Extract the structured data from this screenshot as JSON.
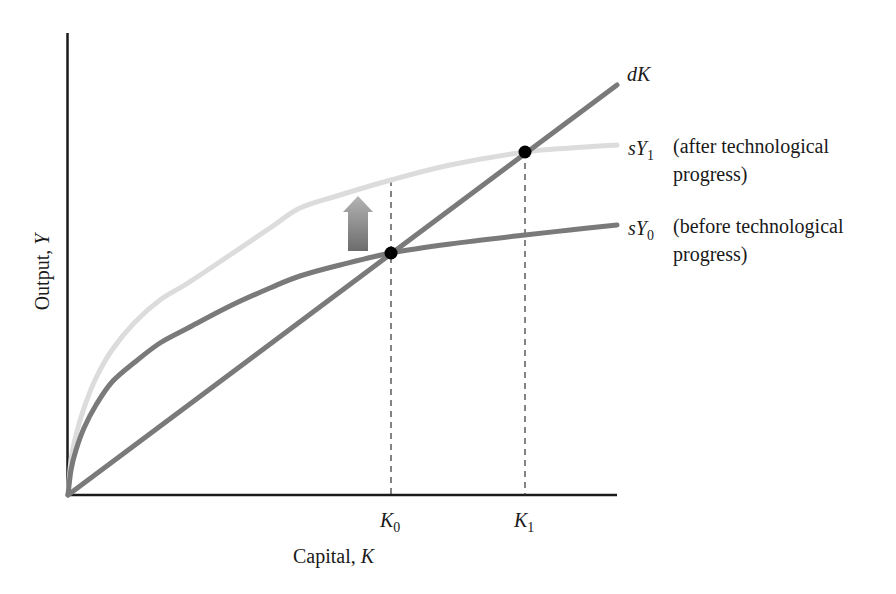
{
  "chart_data": {
    "type": "line",
    "title": "",
    "xlabel": "Capital, K",
    "ylabel": "Output, Y",
    "grid": false,
    "legend_position": "inline-right",
    "x_ticks": [
      "K0",
      "K1"
    ],
    "series": [
      {
        "name": "dK",
        "label": "dK",
        "color": "#7a7a7a",
        "style": "straight line through origin",
        "points": [
          [
            68,
            495
          ],
          [
            617,
            85
          ]
        ]
      },
      {
        "name": "sY1",
        "label": "sY1",
        "description": "(after technological progress)",
        "color": "#dcdcdc",
        "style": "concave curve",
        "points": [
          [
            68,
            495
          ],
          [
            71,
            460
          ],
          [
            76,
            435
          ],
          [
            84,
            408
          ],
          [
            96,
            378
          ],
          [
            112,
            350
          ],
          [
            135,
            322
          ],
          [
            160,
            300
          ],
          [
            188,
            283
          ],
          [
            230,
            255
          ],
          [
            270,
            228
          ],
          [
            300,
            208
          ],
          [
            340,
            195
          ],
          [
            391,
            180
          ],
          [
            450,
            165
          ],
          [
            525,
            152
          ],
          [
            570,
            148
          ],
          [
            617,
            145
          ]
        ]
      },
      {
        "name": "sY0",
        "label": "sY0",
        "description": "(before technological progress)",
        "color": "#7a7a7a",
        "style": "concave curve",
        "points": [
          [
            68,
            495
          ],
          [
            71,
            470
          ],
          [
            76,
            450
          ],
          [
            84,
            428
          ],
          [
            96,
            405
          ],
          [
            112,
            382
          ],
          [
            135,
            362
          ],
          [
            160,
            343
          ],
          [
            188,
            328
          ],
          [
            230,
            306
          ],
          [
            270,
            288
          ],
          [
            300,
            276
          ],
          [
            340,
            265
          ],
          [
            391,
            253
          ],
          [
            450,
            244
          ],
          [
            525,
            235
          ],
          [
            570,
            230
          ],
          [
            617,
            225
          ]
        ]
      }
    ],
    "equilibria": [
      {
        "name": "K0",
        "x": 391,
        "y": 253,
        "dashed_from_y": 180
      },
      {
        "name": "K1",
        "x": 525,
        "y": 152,
        "dashed_from_y": 152
      }
    ],
    "annotations": [
      "upward shift arrow from sY0 to sY1"
    ]
  },
  "labels": {
    "dK": "dK",
    "sY1_s": "sY",
    "sY1_sub": "1",
    "sY1_desc_line1": "(after technological",
    "sY1_desc_line2": "progress)",
    "sY0_s": "sY",
    "sY0_sub": "0",
    "sY0_desc_line1": "(before technological",
    "sY0_desc_line2": "progress)",
    "k0": "K",
    "k0_sub": "0",
    "k1": "K",
    "k1_sub": "1",
    "xlabel_text": "Capital, ",
    "xlabel_var": "K",
    "ylabel_text": "Output, ",
    "ylabel_var": "Y"
  },
  "colors": {
    "axis": "#1a1a1a",
    "dK": "#7a7a7a",
    "sY0": "#7a7a7a",
    "sY1": "#dcdcdc",
    "dot": "#000000",
    "arrow_top": "#b0b0b0",
    "arrow_bottom": "#6e6e6e"
  }
}
